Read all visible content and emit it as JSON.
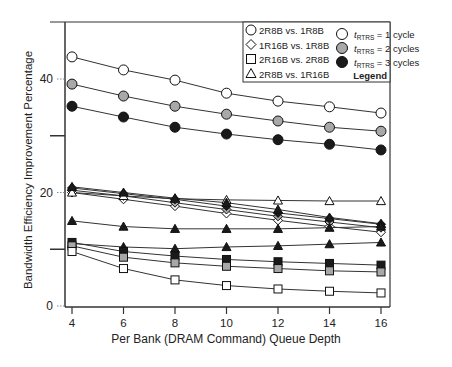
{
  "chart_data": {
    "type": "line",
    "title": "",
    "xlabel": "Per Bank (DRAM Command) Queue Depth",
    "ylabel": "Bandwidth Efficiency Improvement Percentage",
    "x": [
      4,
      6,
      8,
      10,
      12,
      14,
      16
    ],
    "x_ticks": [
      "4",
      "6",
      "8",
      "10",
      "12",
      "14",
      "16"
    ],
    "y_ticks": [
      "0",
      "20",
      "40"
    ],
    "ylim": [
      0,
      47
    ],
    "xlim": [
      3.6,
      16.4
    ],
    "grid": false,
    "legend_position": "upper right",
    "legend": {
      "title": "Legend",
      "shape_entries": [
        {
          "shape": "circle",
          "label": "2R8B vs. 1R8B"
        },
        {
          "shape": "diamond",
          "label": "1R16B vs. 1R8B"
        },
        {
          "shape": "square",
          "label": "2R16B vs. 2R8B"
        },
        {
          "shape": "triangle",
          "label": "2R8B vs. 1R16B"
        }
      ],
      "fill_entries": [
        {
          "fill": "white",
          "prefix": "t",
          "sub": "RTRS",
          "label": " = 1 cycle"
        },
        {
          "fill": "gray",
          "prefix": "t",
          "sub": "RTRS",
          "label": " = 2 cycles"
        },
        {
          "fill": "black",
          "prefix": "t",
          "sub": "RTRS",
          "label": " = 3 cycles"
        }
      ]
    },
    "series": [
      {
        "name": "2R8B vs. 1R8B, tRTRS = 1 cycle",
        "shape": "circle",
        "fill": "white",
        "values": [
          43.9,
          41.6,
          39.8,
          37.5,
          36.1,
          35.1,
          34.0
        ]
      },
      {
        "name": "2R8B vs. 1R8B, tRTRS = 2 cycles",
        "shape": "circle",
        "fill": "gray",
        "values": [
          39.1,
          37.0,
          35.2,
          33.8,
          32.6,
          31.5,
          30.8
        ]
      },
      {
        "name": "2R8B vs. 1R8B, tRTRS = 3 cycles",
        "shape": "circle",
        "fill": "black",
        "values": [
          35.2,
          33.3,
          31.5,
          30.3,
          29.3,
          28.5,
          27.5
        ]
      },
      {
        "name": "1R16B vs. 1R8B, tRTRS = 1 cycle",
        "shape": "diamond",
        "fill": "white",
        "values": [
          20.0,
          18.8,
          17.6,
          16.3,
          15.1,
          14.0,
          13.0
        ]
      },
      {
        "name": "1R16B vs. 1R8B, tRTRS = 2 cycles",
        "shape": "diamond",
        "fill": "gray",
        "values": [
          20.4,
          19.4,
          18.2,
          17.0,
          15.8,
          14.8,
          13.8
        ]
      },
      {
        "name": "1R16B vs. 1R8B, tRTRS = 3 cycles",
        "shape": "diamond",
        "fill": "black",
        "values": [
          20.8,
          19.8,
          18.8,
          17.6,
          16.4,
          15.4,
          14.4
        ]
      },
      {
        "name": "2R8B vs. 1R16B, tRTRS = 1 cycle",
        "shape": "triangle",
        "fill": "white",
        "values": [
          20.0,
          19.4,
          18.9,
          18.7,
          18.6,
          18.5,
          18.5
        ]
      },
      {
        "name": "2R8B vs. 1R16B, tRTRS = 2 cycles",
        "shape": "triangle",
        "fill": "black",
        "values": [
          21.0,
          20.0,
          19.0,
          18.2,
          17.0,
          15.6,
          14.5
        ]
      },
      {
        "name": "2R8B vs. 1R16B, tRTRS = 3 cycles",
        "shape": "triangle",
        "fill": "black",
        "values": [
          15.0,
          14.0,
          13.6,
          13.6,
          13.6,
          13.8,
          14.0
        ]
      },
      {
        "name": "2R8B vs. 1R16B (lower), tRTRS = 3 cycles",
        "shape": "triangle",
        "fill": "black",
        "values": [
          11.0,
          10.4,
          10.1,
          10.4,
          10.6,
          10.9,
          11.2
        ]
      },
      {
        "name": "2R16B vs. 2R8B, tRTRS = 3 cycles",
        "shape": "square",
        "fill": "black",
        "values": [
          11.2,
          9.6,
          8.8,
          8.2,
          7.8,
          7.5,
          7.2
        ]
      },
      {
        "name": "2R16B vs. 2R8B, tRTRS = 2 cycles",
        "shape": "square",
        "fill": "gray",
        "values": [
          10.6,
          8.6,
          7.6,
          7.0,
          6.6,
          6.2,
          6.0
        ]
      },
      {
        "name": "2R16B vs. 2R8B, tRTRS = 1 cycle",
        "shape": "square",
        "fill": "white",
        "values": [
          9.6,
          6.6,
          4.6,
          3.6,
          3.0,
          2.6,
          2.3
        ]
      }
    ]
  }
}
